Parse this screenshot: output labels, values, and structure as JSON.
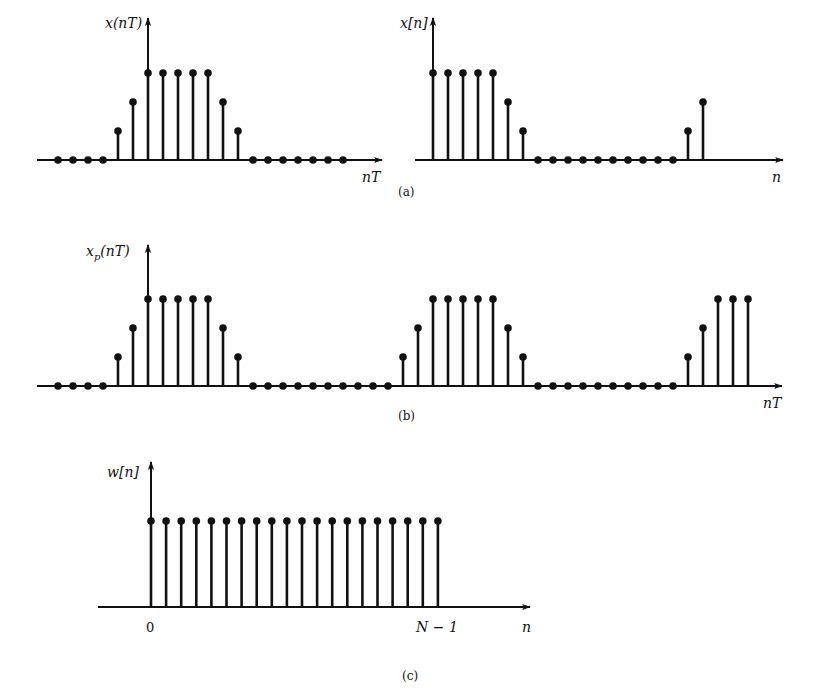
{
  "figure": {
    "captions": {
      "a": "(a)",
      "b": "(b)",
      "c": "(c)"
    },
    "colors": {
      "ink": "#111111",
      "background": "#ffffff"
    }
  },
  "chart_data": [
    {
      "id": "a-left",
      "type": "stem",
      "title": "",
      "ylabel": "x(nT)",
      "xlabel": "nT",
      "caption": "(a)",
      "values": [
        0,
        0,
        0,
        0,
        1,
        2,
        3,
        3,
        3,
        3,
        3,
        2,
        1,
        0,
        0,
        0,
        0,
        0,
        0,
        0
      ],
      "origin_index": 6,
      "grid": false
    },
    {
      "id": "a-right",
      "type": "stem",
      "title": "",
      "ylabel": "x[n]",
      "xlabel": "n",
      "caption": "(a)",
      "values": [
        3,
        3,
        3,
        3,
        3,
        2,
        1,
        0,
        0,
        0,
        0,
        0,
        0,
        0,
        0,
        0,
        0,
        1,
        2
      ],
      "origin_index": 0,
      "grid": false
    },
    {
      "id": "b",
      "type": "stem",
      "title": "",
      "ylabel": "x_p(nT)",
      "xlabel": "nT",
      "caption": "(b)",
      "values": [
        0,
        0,
        0,
        0,
        1,
        2,
        3,
        3,
        3,
        3,
        3,
        2,
        1,
        0,
        0,
        0,
        0,
        0,
        0,
        0,
        0,
        0,
        0,
        1,
        2,
        3,
        3,
        3,
        3,
        3,
        2,
        1,
        0,
        0,
        0,
        0,
        0,
        0,
        0,
        0,
        0,
        0,
        1,
        2,
        3,
        3,
        3
      ],
      "origin_index": 6,
      "grid": false
    },
    {
      "id": "c",
      "type": "stem",
      "title": "",
      "ylabel": "w[n]",
      "xlabel": "n",
      "caption": "(c)",
      "values": [
        1,
        1,
        1,
        1,
        1,
        1,
        1,
        1,
        1,
        1,
        1,
        1,
        1,
        1,
        1,
        1,
        1,
        1,
        1,
        1
      ],
      "origin_index": 0,
      "tick_labels": [
        "0",
        "N − 1"
      ],
      "grid": false
    }
  ]
}
